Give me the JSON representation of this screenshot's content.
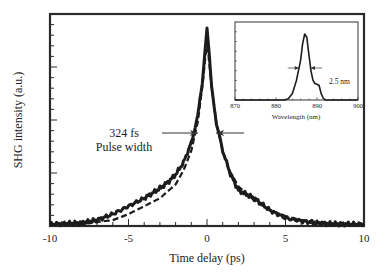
{
  "chart_data": {
    "type": "line",
    "title": "",
    "xlabel": "Time delay (ps)",
    "ylabel": "SHG intensity (a.u.)",
    "xlim": [
      -10,
      10
    ],
    "ylim": [
      0,
      1.05
    ],
    "x_ticks": [
      "-10",
      "-5",
      "0",
      "5",
      "10"
    ],
    "grid": false,
    "annotations": [
      {
        "text": "324 fs",
        "line2": "Pulse width",
        "type": "fwhm-arrows"
      }
    ],
    "series": [
      {
        "name": "measured autocorrelation",
        "style": "solid",
        "x": [
          -10,
          -8,
          -7,
          -6,
          -5,
          -4,
          -3,
          -2.5,
          -2,
          -1.5,
          -1,
          -0.6,
          -0.3,
          -0.15,
          0,
          0.15,
          0.3,
          0.6,
          1,
          1.5,
          2,
          2.5,
          3,
          4,
          5,
          6,
          7,
          8,
          10
        ],
        "y": [
          0.01,
          0.015,
          0.03,
          0.06,
          0.1,
          0.14,
          0.19,
          0.22,
          0.26,
          0.32,
          0.42,
          0.55,
          0.72,
          0.86,
          1.0,
          0.86,
          0.7,
          0.52,
          0.38,
          0.26,
          0.18,
          0.16,
          0.14,
          0.08,
          0.04,
          0.025,
          0.015,
          0.01,
          0.01
        ]
      },
      {
        "name": "fit",
        "style": "dashed",
        "x": [
          -10,
          -8,
          -6,
          -5,
          -4,
          -3,
          -2,
          -1.5,
          -1,
          -0.6,
          -0.3,
          0,
          0.3,
          0.6,
          1,
          1.5,
          2,
          3,
          4,
          5,
          6,
          8,
          10
        ],
        "y": [
          0.005,
          0.01,
          0.03,
          0.06,
          0.1,
          0.14,
          0.21,
          0.28,
          0.38,
          0.52,
          0.7,
          0.93,
          0.7,
          0.52,
          0.38,
          0.27,
          0.2,
          0.13,
          0.08,
          0.05,
          0.03,
          0.01,
          0.005
        ]
      }
    ],
    "inset": {
      "type": "line",
      "xlabel": "Wavelength (nm)",
      "xlim": [
        870,
        900
      ],
      "x_ticks": [
        "870",
        "880",
        "890",
        "900"
      ],
      "annotation": "2.5 nm",
      "series": [
        {
          "name": "spectrum",
          "x": [
            870,
            882,
            883,
            884,
            885,
            886,
            886.5,
            887,
            887.5,
            888,
            888.5,
            889,
            889.5,
            890,
            890.5,
            891,
            891.5,
            892,
            900
          ],
          "y": [
            0,
            0,
            0.02,
            0.1,
            0.3,
            0.6,
            0.85,
            1.0,
            0.95,
            0.7,
            0.45,
            0.3,
            0.25,
            0.24,
            0.22,
            0.1,
            0.03,
            0,
            0
          ]
        }
      ]
    }
  },
  "labels": {
    "xlabel": "Time delay (ps)",
    "ylabel": "SHG intensity (a.u.)",
    "annotation_line1": "324 fs",
    "annotation_line2": "Pulse width",
    "inset_xlabel": "Wavelength (nm)",
    "inset_annotation": "2.5 nm"
  }
}
